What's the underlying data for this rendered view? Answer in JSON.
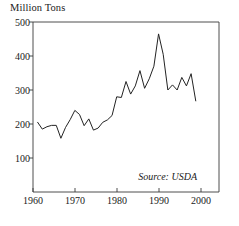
{
  "chart_data": {
    "type": "line",
    "title": "",
    "ylabel": "Million Tons",
    "xlabel": "",
    "ylim": [
      0,
      500
    ],
    "xlim": [
      1960,
      2000
    ],
    "yticks": [
      100,
      200,
      300,
      400,
      500
    ],
    "xticks": [
      1960,
      1970,
      1980,
      1990,
      2000
    ],
    "grid": false,
    "legend": null,
    "annotation": "Source: USDA",
    "series": [
      {
        "name": "Million Tons",
        "x": [
          1961,
          1962,
          1963,
          1964,
          1965,
          1966,
          1967,
          1968,
          1969,
          1970,
          1971,
          1972,
          1973,
          1974,
          1975,
          1976,
          1977,
          1978,
          1979,
          1980,
          1981,
          1982,
          1983,
          1984,
          1985,
          1986,
          1987,
          1988,
          1989,
          1990,
          1991,
          1992,
          1993,
          1994,
          1995
        ],
        "values": [
          205,
          185,
          192,
          196,
          196,
          158,
          190,
          213,
          240,
          228,
          195,
          215,
          182,
          188,
          205,
          212,
          225,
          280,
          278,
          325,
          288,
          312,
          357,
          305,
          333,
          370,
          465,
          405,
          300,
          315,
          300,
          337,
          312,
          348,
          268
        ]
      }
    ]
  },
  "axis": {
    "ytick_labels": [
      "500",
      "400",
      "300",
      "200",
      "100"
    ],
    "xtick_labels": [
      "1960",
      "1970",
      "1980",
      "1990",
      "2000"
    ]
  },
  "labels": {
    "ylabel": "Million Tons",
    "source": "Source: USDA"
  }
}
